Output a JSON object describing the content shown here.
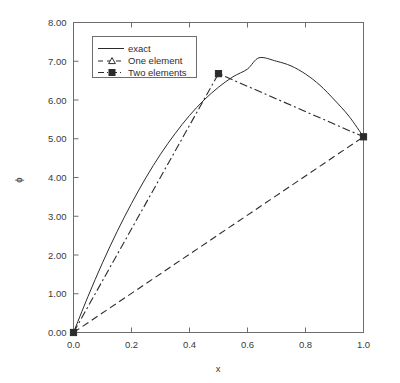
{
  "chart_data": {
    "type": "line",
    "title": "",
    "xlabel": "x",
    "ylabel": "ϕ",
    "xlim": [
      0.0,
      1.0
    ],
    "ylim": [
      0.0,
      8.0
    ],
    "xticks": [
      0.0,
      0.2,
      0.4,
      0.6,
      0.8,
      1.0
    ],
    "xtick_labels": [
      "0.0",
      "0.2",
      "0.4",
      "0.6",
      "0.8",
      "1.0"
    ],
    "yticks": [
      0.0,
      1.0,
      2.0,
      3.0,
      4.0,
      5.0,
      6.0,
      7.0,
      8.0
    ],
    "ytick_labels": [
      "0.00",
      "1.00",
      "2.00",
      "3.00",
      "4.00",
      "5.00",
      "6.00",
      "7.00",
      "8.00"
    ],
    "grid": false,
    "legend_position": "upper left",
    "series": [
      {
        "name": "exact",
        "style": "solid",
        "marker": "none",
        "color": "#2b2b2b",
        "x": [
          0.0,
          0.05,
          0.1,
          0.15,
          0.2,
          0.25,
          0.3,
          0.35,
          0.4,
          0.45,
          0.5,
          0.55,
          0.6,
          0.64,
          0.7,
          0.75,
          0.8,
          0.85,
          0.9,
          0.95,
          1.0
        ],
        "y": [
          0.0,
          0.93,
          1.8,
          2.6,
          3.33,
          4.0,
          4.6,
          5.13,
          5.6,
          6.0,
          6.33,
          6.6,
          6.8,
          7.09,
          7.0,
          6.88,
          6.67,
          6.38,
          6.0,
          5.58,
          5.05
        ]
      },
      {
        "name": "One element",
        "style": "dashed",
        "marker": "triangle-open",
        "color": "#2b2b2b",
        "x": [
          0.0,
          1.0
        ],
        "y": [
          0.0,
          5.05
        ]
      },
      {
        "name": "Two elements",
        "style": "dash-dot",
        "marker": "square-filled",
        "color": "#2b2b2b",
        "x": [
          0.0,
          0.5,
          1.0
        ],
        "y": [
          0.0,
          6.68,
          5.05
        ]
      }
    ],
    "markers": [
      {
        "series": "Two elements",
        "x": 0.0,
        "y": 0.0
      },
      {
        "series": "Two elements",
        "x": 0.5,
        "y": 6.68
      },
      {
        "series": "Two elements",
        "x": 1.0,
        "y": 5.05
      }
    ],
    "legend_entries": [
      {
        "label": "exact",
        "style": "solid",
        "marker": "none"
      },
      {
        "label": "One element",
        "style": "dashed",
        "marker": "triangle-open"
      },
      {
        "label": "Two elements",
        "style": "dash-dot",
        "marker": "square-filled"
      }
    ],
    "colors": {
      "line": "#2b2b2b",
      "axis": "#6d6d6d",
      "text": "#3a3a3a",
      "background": "#ffffff"
    }
  }
}
